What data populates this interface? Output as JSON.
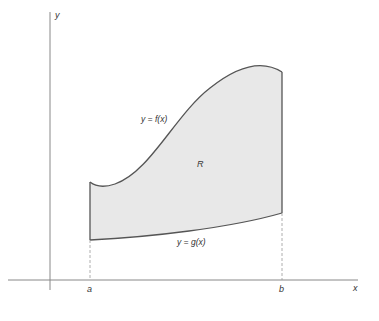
{
  "diagram": {
    "axes": {
      "x_label": "x",
      "y_label": "y"
    },
    "region_label": "R",
    "upper_curve_label": "y = f(x)",
    "lower_curve_label": "y = g(x)",
    "bounds": {
      "left": "a",
      "right": "b"
    },
    "colors": {
      "fill": "#e8e8e8",
      "stroke": "#555555",
      "axis": "#777777"
    }
  }
}
